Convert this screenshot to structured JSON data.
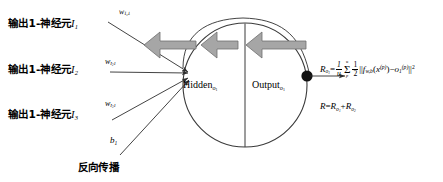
{
  "diagram": {
    "background_color": "#ffffff",
    "stroke_color": "#3a3a3a",
    "arrow_fill": "#a6a6a6",
    "arrow_stroke": "#6e6e6e"
  },
  "inputs": [
    {
      "label_prefix": "输出1-神经元",
      "label_symbol": "I",
      "label_index": "1",
      "weight_base": "w",
      "weight_sub": "I",
      "weight_sub_index": "1",
      "weight_target": "1"
    },
    {
      "label_prefix": "输出1-神经元",
      "label_symbol": "I",
      "label_index": "2",
      "weight_base": "w",
      "weight_sub": "I",
      "weight_sub_index": "2",
      "weight_target": "1"
    },
    {
      "label_prefix": "输出1-神经元",
      "label_symbol": "I",
      "label_index": "3",
      "weight_base": "w",
      "weight_sub": "I",
      "weight_sub_index": "3",
      "weight_target": "1"
    }
  ],
  "bias": {
    "base": "b",
    "index": "1"
  },
  "bottom_caption": "反向传播",
  "neuron": {
    "hidden_label": "Hidden",
    "hidden_sub": "o",
    "hidden_sub_index": "1",
    "output_label": "Output",
    "output_sub": "o",
    "output_sub_index": "1"
  },
  "equations": {
    "error_lhs": "R",
    "error_lhs_sub": "o",
    "error_lhs_sub_index": "1",
    "eq_sign": "=",
    "frac1_num": "1",
    "frac1_den": "u",
    "sigma_top": "u",
    "sigma_symbol": "Σ",
    "sigma_bot": "p",
    "frac2_num": "1",
    "frac2_den": "2",
    "norm_open": "||",
    "func": "f",
    "func_sub": "w,b",
    "arg_open": "(",
    "arg_var": "x",
    "arg_sup": "(p)",
    "arg_close": ")",
    "minus": "−",
    "target": "o",
    "target_sub": "1",
    "target_sup": "(p)",
    "norm_close": "||",
    "norm_pow": "2",
    "total_lhs": "R",
    "total_eq": "=",
    "total_term1": "R",
    "total_term1_sub": "o",
    "total_term1_sub_index": "1",
    "total_plus": "+",
    "total_term2": "R",
    "total_term2_sub": "o",
    "total_term2_sub_index": "2"
  }
}
